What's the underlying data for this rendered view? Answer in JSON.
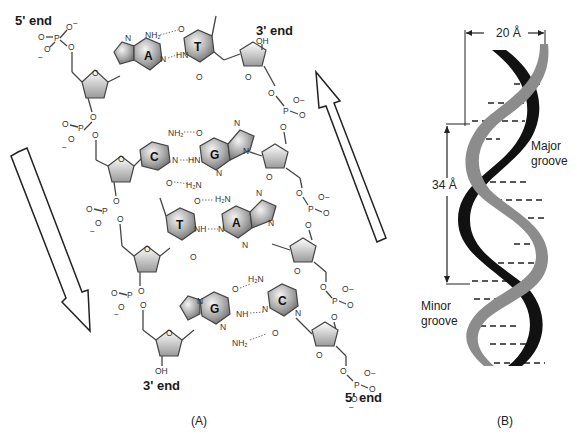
{
  "panel_a": {
    "label": "(A)",
    "ends": {
      "top_left": "5' end",
      "top_right": "3' end",
      "bottom_left": "3' end",
      "bottom_right": "5' end"
    },
    "base_pairs": [
      {
        "left": "A",
        "right": "T",
        "bonds": 2
      },
      {
        "left": "C",
        "right": "G",
        "bonds": 3
      },
      {
        "left": "T",
        "right": "A",
        "bonds": 2
      },
      {
        "left": "G",
        "right": "C",
        "bonds": 3
      }
    ],
    "arrows": [
      {
        "name": "strand-direction-down",
        "direction": "down"
      },
      {
        "name": "strand-direction-up",
        "direction": "up"
      }
    ],
    "atoms": {
      "phosphorus": "P",
      "oxygen": "O",
      "nitrogen": "N",
      "amine": "NH₂",
      "amine_alt": "H₂N",
      "imine": "NH",
      "imine_alt": "HN",
      "hydroxyl": "OH",
      "minus": "−"
    }
  },
  "panel_b": {
    "label": "(B)",
    "width_label": "20 Å",
    "pitch_label": "34 Å",
    "major_groove_line1": "Major",
    "major_groove_line2": "groove",
    "minor_groove_line1": "Minor",
    "minor_groove_line2": "groove",
    "strand_colors": {
      "strand1": "#111111",
      "strand2": "#8c8c8c"
    }
  }
}
